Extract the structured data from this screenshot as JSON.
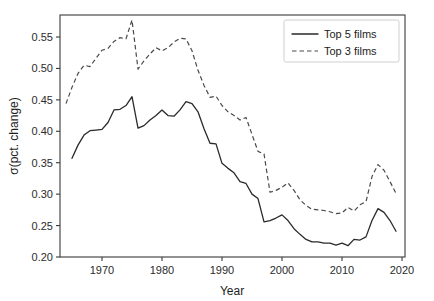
{
  "chart_data": {
    "type": "line",
    "title": "",
    "xlabel": "Year",
    "ylabel": "σ(pct. change)",
    "xlim": [
      1963,
      2020.5
    ],
    "ylim": [
      0.2,
      0.585
    ],
    "xticks": [
      1970,
      1980,
      1990,
      2000,
      2010,
      2020
    ],
    "xticklabels": [
      "1970",
      "1980",
      "1990",
      "2000",
      "2010",
      "2020"
    ],
    "yticks": [
      0.2,
      0.25,
      0.3,
      0.35,
      0.4,
      0.45,
      0.5,
      0.55
    ],
    "yticklabels": [
      "0.20",
      "0.25",
      "0.30",
      "0.35",
      "0.40",
      "0.45",
      "0.50",
      "0.55"
    ],
    "grid": false,
    "legend_position": "upper right",
    "legend_entries": [
      "Top 5 films",
      "Top 3 films"
    ],
    "series": [
      {
        "name": "Top 5 films",
        "style": "solid",
        "color": "#2a2a2a",
        "x": [
          1965,
          1966,
          1967,
          1968,
          1969,
          1970,
          1971,
          1972,
          1973,
          1974,
          1975,
          1976,
          1977,
          1978,
          1979,
          1980,
          1981,
          1982,
          1983,
          1984,
          1985,
          1986,
          1987,
          1988,
          1989,
          1990,
          1991,
          1992,
          1993,
          1994,
          1995,
          1996,
          1997,
          1998,
          1999,
          2000,
          2001,
          2002,
          2003,
          2004,
          2005,
          2006,
          2007,
          2008,
          2009,
          2010,
          2011,
          2012,
          2013,
          2014,
          2015,
          2016,
          2017,
          2018,
          2019
        ],
        "values": [
          0.357,
          0.378,
          0.394,
          0.401,
          0.402,
          0.403,
          0.414,
          0.434,
          0.435,
          0.441,
          0.455,
          0.405,
          0.409,
          0.418,
          0.425,
          0.434,
          0.425,
          0.424,
          0.434,
          0.447,
          0.444,
          0.431,
          0.404,
          0.381,
          0.38,
          0.349,
          0.341,
          0.334,
          0.32,
          0.317,
          0.3,
          0.293,
          0.256,
          0.258,
          0.262,
          0.267,
          0.258,
          0.245,
          0.236,
          0.228,
          0.224,
          0.224,
          0.222,
          0.222,
          0.219,
          0.222,
          0.218,
          0.228,
          0.227,
          0.232,
          0.258,
          0.277,
          0.271,
          0.258,
          0.241
        ]
      },
      {
        "name": "Top 3 films",
        "style": "dashed",
        "color": "#4a4a4a",
        "x": [
          1964,
          1965,
          1966,
          1967,
          1968,
          1969,
          1970,
          1971,
          1972,
          1973,
          1974,
          1975,
          1976,
          1977,
          1978,
          1979,
          1980,
          1981,
          1982,
          1983,
          1984,
          1985,
          1986,
          1987,
          1988,
          1989,
          1990,
          1991,
          1992,
          1993,
          1994,
          1995,
          1996,
          1997,
          1998,
          1999,
          2000,
          2001,
          2002,
          2003,
          2004,
          2005,
          2006,
          2007,
          2008,
          2009,
          2010,
          2011,
          2012,
          2013,
          2014,
          2015,
          2016,
          2017,
          2018,
          2019
        ],
        "values": [
          0.444,
          0.47,
          0.492,
          0.505,
          0.503,
          0.516,
          0.529,
          0.532,
          0.543,
          0.549,
          0.547,
          0.577,
          0.499,
          0.512,
          0.523,
          0.533,
          0.528,
          0.533,
          0.542,
          0.548,
          0.547,
          0.528,
          0.497,
          0.473,
          0.454,
          0.456,
          0.441,
          0.431,
          0.425,
          0.418,
          0.422,
          0.395,
          0.368,
          0.364,
          0.303,
          0.306,
          0.311,
          0.318,
          0.306,
          0.291,
          0.282,
          0.276,
          0.275,
          0.274,
          0.272,
          0.269,
          0.27,
          0.279,
          0.273,
          0.283,
          0.288,
          0.328,
          0.347,
          0.338,
          0.32,
          0.301
        ]
      }
    ]
  }
}
